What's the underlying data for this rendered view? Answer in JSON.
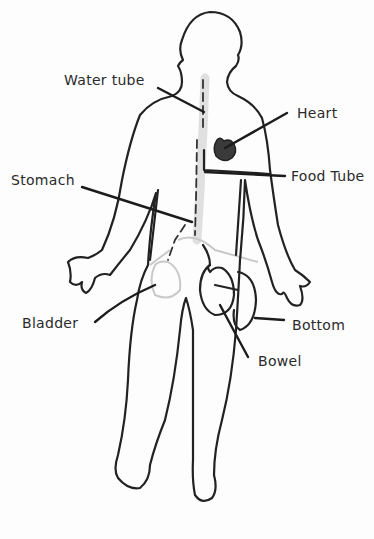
{
  "diagram": {
    "type": "hand-drawn body outline with labeled organs",
    "figure": "human-body-outline",
    "labels": [
      {
        "id": "water-tube",
        "text": "Water tube"
      },
      {
        "id": "heart",
        "text": "Heart"
      },
      {
        "id": "stomach",
        "text": "Stomach"
      },
      {
        "id": "food-tube",
        "text": "Food Tube"
      },
      {
        "id": "bladder",
        "text": "Bladder"
      },
      {
        "id": "bottom",
        "text": "Bottom"
      },
      {
        "id": "bowel",
        "text": "Bowel"
      }
    ],
    "colors": {
      "line": "#222222",
      "heart_fill": "#3a3a3a",
      "shading": "#d5d5d5",
      "background": "#fdfdfd"
    }
  }
}
